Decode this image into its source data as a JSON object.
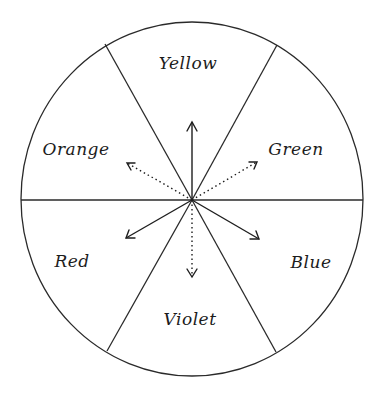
{
  "diagram": {
    "type": "color-wheel",
    "sectors": [
      {
        "name": "Yellow",
        "label": "Yellow",
        "x": 188,
        "y": 64
      },
      {
        "name": "Green",
        "label": "Green",
        "x": 296,
        "y": 150
      },
      {
        "name": "Blue",
        "label": "Blue",
        "x": 311,
        "y": 263
      },
      {
        "name": "Violet",
        "label": "Violet",
        "x": 190,
        "y": 320
      },
      {
        "name": "Red",
        "label": "Red",
        "x": 72,
        "y": 262
      },
      {
        "name": "Orange",
        "label": "Orange",
        "x": 76,
        "y": 150
      }
    ],
    "arrows": [
      {
        "target": "Yellow",
        "style": "solid",
        "tip": [
          192,
          122
        ]
      },
      {
        "target": "Green",
        "style": "dotted",
        "tip": [
          257,
          162
        ]
      },
      {
        "target": "Blue",
        "style": "solid",
        "tip": [
          259,
          239
        ]
      },
      {
        "target": "Violet",
        "style": "dotted",
        "tip": [
          192,
          277
        ]
      },
      {
        "target": "Red",
        "style": "solid",
        "tip": [
          126,
          238
        ]
      },
      {
        "target": "Orange",
        "style": "dotted",
        "tip": [
          127,
          163
        ]
      }
    ],
    "colors": {
      "line": "#2a2a2a",
      "background": "#ffffff"
    }
  }
}
